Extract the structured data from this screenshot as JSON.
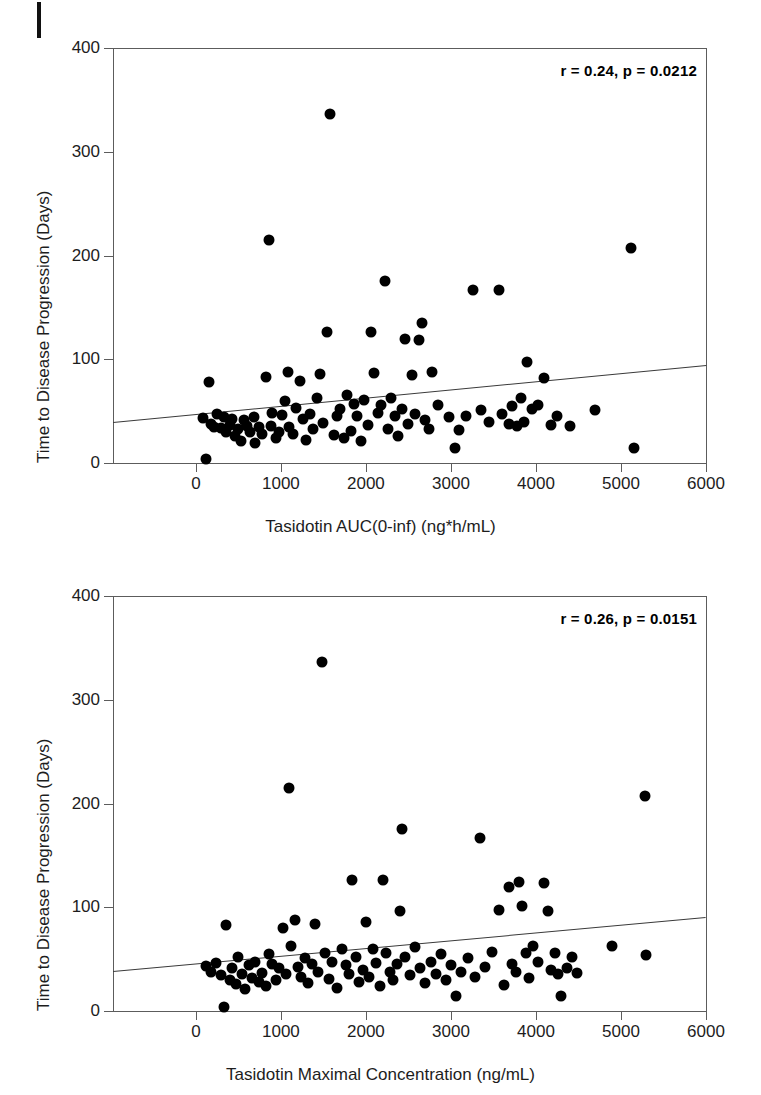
{
  "page": {
    "running_head": "",
    "edge_mark": "black-bar"
  },
  "chart_data": [
    {
      "id": "auc-vs-ttp",
      "type": "scatter",
      "title": "",
      "xlabel": "Tasidotin AUC(0-inf) (ng*h/mL)",
      "ylabel": "Time to Disease Progression (Days)",
      "annotation": "r = 0.24, p = 0.0212",
      "correlation_r": 0.24,
      "p_value": 0.0212,
      "xlim": [
        -975,
        6000
      ],
      "ylim": [
        0,
        400
      ],
      "xticks": [
        0,
        1000,
        2000,
        3000,
        4000,
        5000,
        6000
      ],
      "yticks": [
        0,
        100,
        200,
        300,
        400
      ],
      "grid": false,
      "legend": "none",
      "trendline": {
        "x_start": -975,
        "y_start": 40,
        "x_end": 6000,
        "y_end": 95
      },
      "points": [
        [
          80,
          43
        ],
        [
          120,
          4
        ],
        [
          150,
          78
        ],
        [
          180,
          38
        ],
        [
          210,
          35
        ],
        [
          250,
          47
        ],
        [
          300,
          34
        ],
        [
          330,
          44
        ],
        [
          360,
          30
        ],
        [
          400,
          37
        ],
        [
          430,
          42
        ],
        [
          460,
          26
        ],
        [
          500,
          33
        ],
        [
          530,
          21
        ],
        [
          560,
          41
        ],
        [
          600,
          36
        ],
        [
          640,
          30
        ],
        [
          680,
          44
        ],
        [
          700,
          19
        ],
        [
          740,
          35
        ],
        [
          780,
          28
        ],
        [
          820,
          83
        ],
        [
          860,
          215
        ],
        [
          880,
          36
        ],
        [
          900,
          48
        ],
        [
          940,
          24
        ],
        [
          980,
          30
        ],
        [
          1010,
          46
        ],
        [
          1050,
          60
        ],
        [
          1080,
          88
        ],
        [
          1100,
          35
        ],
        [
          1140,
          28
        ],
        [
          1180,
          53
        ],
        [
          1220,
          79
        ],
        [
          1260,
          42
        ],
        [
          1300,
          22
        ],
        [
          1340,
          47
        ],
        [
          1380,
          33
        ],
        [
          1420,
          63
        ],
        [
          1460,
          86
        ],
        [
          1500,
          39
        ],
        [
          1540,
          126
        ],
        [
          1580,
          336
        ],
        [
          1620,
          27
        ],
        [
          1660,
          45
        ],
        [
          1700,
          52
        ],
        [
          1740,
          24
        ],
        [
          1780,
          66
        ],
        [
          1820,
          31
        ],
        [
          1860,
          57
        ],
        [
          1900,
          45
        ],
        [
          1940,
          21
        ],
        [
          1980,
          61
        ],
        [
          2020,
          37
        ],
        [
          2060,
          126
        ],
        [
          2100,
          87
        ],
        [
          2140,
          48
        ],
        [
          2180,
          56
        ],
        [
          2220,
          175
        ],
        [
          2260,
          33
        ],
        [
          2300,
          63
        ],
        [
          2340,
          45
        ],
        [
          2380,
          26
        ],
        [
          2420,
          52
        ],
        [
          2460,
          120
        ],
        [
          2500,
          38
        ],
        [
          2540,
          85
        ],
        [
          2580,
          47
        ],
        [
          2620,
          119
        ],
        [
          2660,
          135
        ],
        [
          2700,
          41
        ],
        [
          2740,
          33
        ],
        [
          2780,
          88
        ],
        [
          2850,
          56
        ],
        [
          2980,
          44
        ],
        [
          3050,
          14
        ],
        [
          3100,
          32
        ],
        [
          3180,
          45
        ],
        [
          3260,
          167
        ],
        [
          3350,
          51
        ],
        [
          3450,
          40
        ],
        [
          3560,
          167
        ],
        [
          3600,
          47
        ],
        [
          3680,
          38
        ],
        [
          3720,
          55
        ],
        [
          3780,
          36
        ],
        [
          3820,
          63
        ],
        [
          3860,
          40
        ],
        [
          3900,
          97
        ],
        [
          3950,
          52
        ],
        [
          4020,
          56
        ],
        [
          4100,
          82
        ],
        [
          4180,
          37
        ],
        [
          4250,
          45
        ],
        [
          4400,
          36
        ],
        [
          4700,
          51
        ],
        [
          5120,
          207
        ],
        [
          5150,
          14
        ]
      ]
    },
    {
      "id": "cmax-vs-ttp",
      "type": "scatter",
      "title": "",
      "xlabel": "Tasidotin Maximal Concentration (ng/mL)",
      "ylabel": "Time to Disease Progression (Days)",
      "annotation": "r = 0.26, p = 0.0151",
      "correlation_r": 0.26,
      "p_value": 0.0151,
      "xlim": [
        -975,
        6000
      ],
      "ylim": [
        0,
        400
      ],
      "xticks": [
        0,
        1000,
        2000,
        3000,
        4000,
        5000,
        6000
      ],
      "yticks": [
        0,
        100,
        200,
        300,
        400
      ],
      "grid": false,
      "legend": "none",
      "trendline": {
        "x_start": -975,
        "y_start": 39,
        "x_end": 6000,
        "y_end": 91
      },
      "points": [
        [
          120,
          43
        ],
        [
          180,
          38
        ],
        [
          240,
          46
        ],
        [
          300,
          35
        ],
        [
          330,
          4
        ],
        [
          360,
          83
        ],
        [
          400,
          30
        ],
        [
          430,
          41
        ],
        [
          470,
          26
        ],
        [
          500,
          52
        ],
        [
          540,
          36
        ],
        [
          580,
          21
        ],
        [
          620,
          44
        ],
        [
          660,
          32
        ],
        [
          700,
          47
        ],
        [
          740,
          28
        ],
        [
          780,
          37
        ],
        [
          820,
          24
        ],
        [
          860,
          55
        ],
        [
          900,
          45
        ],
        [
          940,
          30
        ],
        [
          980,
          41
        ],
        [
          1020,
          80
        ],
        [
          1060,
          36
        ],
        [
          1100,
          215
        ],
        [
          1120,
          63
        ],
        [
          1160,
          88
        ],
        [
          1200,
          42
        ],
        [
          1240,
          33
        ],
        [
          1280,
          51
        ],
        [
          1320,
          27
        ],
        [
          1360,
          45
        ],
        [
          1400,
          84
        ],
        [
          1440,
          38
        ],
        [
          1480,
          336
        ],
        [
          1520,
          56
        ],
        [
          1560,
          31
        ],
        [
          1600,
          47
        ],
        [
          1660,
          22
        ],
        [
          1720,
          60
        ],
        [
          1760,
          44
        ],
        [
          1800,
          36
        ],
        [
          1840,
          126
        ],
        [
          1880,
          52
        ],
        [
          1920,
          28
        ],
        [
          1960,
          40
        ],
        [
          2000,
          86
        ],
        [
          2040,
          33
        ],
        [
          2080,
          60
        ],
        [
          2120,
          46
        ],
        [
          2160,
          24
        ],
        [
          2200,
          126
        ],
        [
          2240,
          56
        ],
        [
          2280,
          38
        ],
        [
          2320,
          30
        ],
        [
          2360,
          45
        ],
        [
          2400,
          96
        ],
        [
          2420,
          175
        ],
        [
          2460,
          52
        ],
        [
          2520,
          35
        ],
        [
          2580,
          62
        ],
        [
          2640,
          41
        ],
        [
          2700,
          27
        ],
        [
          2760,
          47
        ],
        [
          2820,
          36
        ],
        [
          2880,
          55
        ],
        [
          2940,
          30
        ],
        [
          3000,
          44
        ],
        [
          3060,
          14
        ],
        [
          3120,
          38
        ],
        [
          3200,
          51
        ],
        [
          3280,
          33
        ],
        [
          3340,
          167
        ],
        [
          3400,
          42
        ],
        [
          3480,
          57
        ],
        [
          3560,
          97
        ],
        [
          3620,
          25
        ],
        [
          3680,
          120
        ],
        [
          3720,
          45
        ],
        [
          3760,
          38
        ],
        [
          3800,
          124
        ],
        [
          3840,
          101
        ],
        [
          3880,
          56
        ],
        [
          3920,
          32
        ],
        [
          3960,
          63
        ],
        [
          4020,
          47
        ],
        [
          4100,
          123
        ],
        [
          4140,
          96
        ],
        [
          4180,
          40
        ],
        [
          4220,
          56
        ],
        [
          4260,
          36
        ],
        [
          4300,
          14
        ],
        [
          4360,
          41
        ],
        [
          4420,
          52
        ],
        [
          4480,
          37
        ],
        [
          4900,
          63
        ],
        [
          5280,
          207
        ],
        [
          5300,
          54
        ]
      ]
    }
  ]
}
